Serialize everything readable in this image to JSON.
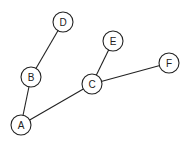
{
  "diagram": {
    "type": "graph",
    "nodes": [
      {
        "id": "A",
        "label": "A",
        "x": 21,
        "y": 125
      },
      {
        "id": "B",
        "label": "B",
        "x": 31,
        "y": 77
      },
      {
        "id": "C",
        "label": "C",
        "x": 92,
        "y": 84
      },
      {
        "id": "D",
        "label": "D",
        "x": 63,
        "y": 22
      },
      {
        "id": "E",
        "label": "E",
        "x": 113,
        "y": 41
      },
      {
        "id": "F",
        "label": "F",
        "x": 169,
        "y": 63
      }
    ],
    "edges": [
      {
        "from": "A",
        "to": "B"
      },
      {
        "from": "B",
        "to": "D"
      },
      {
        "from": "A",
        "to": "C"
      },
      {
        "from": "C",
        "to": "E"
      },
      {
        "from": "C",
        "to": "F"
      }
    ],
    "node_radius": 10,
    "colors": {
      "stroke": "#222222",
      "fill": "#ffffff",
      "background": "#ffffff"
    }
  }
}
